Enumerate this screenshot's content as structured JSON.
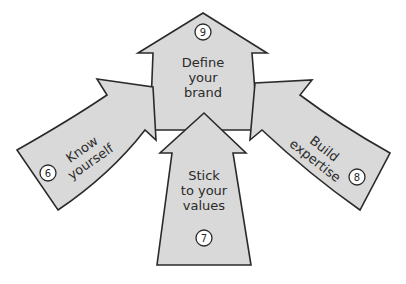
{
  "diagram": {
    "type": "converging-arrows",
    "arrows": [
      {
        "id": "top",
        "number": "9",
        "lines": [
          "Define",
          "your",
          "brand"
        ]
      },
      {
        "id": "left",
        "number": "6",
        "lines": [
          "Know",
          "yourself"
        ]
      },
      {
        "id": "right",
        "number": "8",
        "lines": [
          "Build",
          "expertise"
        ]
      },
      {
        "id": "bottom",
        "number": "7",
        "lines": [
          "Stick",
          "to your",
          "values"
        ]
      }
    ],
    "colors": {
      "fill": "#d9d9d9",
      "stroke": "#2a2a2a",
      "badge_fill": "#ffffff"
    }
  }
}
